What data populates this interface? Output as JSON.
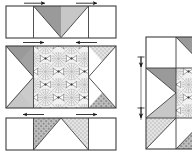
{
  "figure": {
    "type": "quilt-piecing-diagram",
    "canvas": {
      "width": 192,
      "height": 157
    },
    "line_color": "#3a3a3a",
    "palette": {
      "background": "#ffffff",
      "white_patch": "#ffffff",
      "solid_gray": "#9a9a9a",
      "light_gray": "#c9c9c9",
      "dot_gray": "#b4b4b4",
      "floral_bg": "#efefef",
      "outline": "#3d3d3d",
      "arrow": "#1a1a1a"
    }
  },
  "left_figure": {
    "name": "three-row-strips",
    "rows": [
      {
        "id": "row-top",
        "label": "top row",
        "x": 6,
        "y": 6,
        "width": 110,
        "height": 32,
        "patches": [
          {
            "name": "corner-square-left",
            "fill": "white_patch"
          },
          {
            "name": "triangle-down-left",
            "fill": "solid_gray"
          },
          {
            "name": "triangle-down-right",
            "fill": "light_gray"
          },
          {
            "name": "corner-square-right",
            "fill": "white_patch"
          }
        ],
        "arrows": [
          {
            "name": "press-arrow-left",
            "direction": "right",
            "x": 28,
            "y": 3
          },
          {
            "name": "press-arrow-right",
            "direction": "right",
            "x": 80,
            "y": 3
          }
        ]
      },
      {
        "id": "row-middle",
        "label": "middle row",
        "x": 6,
        "y": 46,
        "width": 110,
        "height": 62,
        "patches": [
          {
            "name": "side-triangle-left",
            "fill": "white_patch"
          },
          {
            "name": "corner-triangle-top-left",
            "fill": "solid_gray"
          },
          {
            "name": "corner-triangle-bottom-left",
            "fill": "light_gray"
          },
          {
            "name": "center-square-floral",
            "fill": "floral_bg"
          },
          {
            "name": "side-triangle-right",
            "fill": "white_patch"
          },
          {
            "name": "corner-triangle-top-right",
            "fill": "dot_gray"
          },
          {
            "name": "corner-triangle-bottom-right",
            "fill": "dot_gray"
          }
        ],
        "arrows": [
          {
            "name": "press-arrow-left",
            "direction": "right",
            "x": 27,
            "y": 42
          },
          {
            "name": "press-arrow-right",
            "direction": "left",
            "x": 80,
            "y": 42
          }
        ]
      },
      {
        "id": "row-bottom",
        "label": "bottom row",
        "x": 6,
        "y": 118,
        "width": 110,
        "height": 32,
        "patches": [
          {
            "name": "corner-square-left",
            "fill": "white_patch"
          },
          {
            "name": "triangle-up-left",
            "fill": "dot_gray"
          },
          {
            "name": "triangle-up-right",
            "fill": "light_gray"
          },
          {
            "name": "corner-square-right",
            "fill": "white_patch"
          }
        ],
        "arrows": [
          {
            "name": "press-arrow-left",
            "direction": "left",
            "x": 27,
            "y": 115
          },
          {
            "name": "press-arrow-right",
            "direction": "right",
            "x": 80,
            "y": 115
          }
        ]
      }
    ]
  },
  "right_figure": {
    "name": "assembled-block",
    "label": "assembled block",
    "x": 146,
    "y": 37,
    "width": 58,
    "height": 112,
    "cropped_at_right_edge": true,
    "rows": [
      {
        "name": "assembled-row-top",
        "height": 31
      },
      {
        "name": "assembled-row-middle",
        "height": 50
      },
      {
        "name": "assembled-row-bottom",
        "height": 31
      }
    ],
    "patches": [
      {
        "name": "top-left-square",
        "fill": "white_patch"
      },
      {
        "name": "top-right-triangle",
        "fill": "solid_gray"
      },
      {
        "name": "middle-left-triangle",
        "fill": "white_patch"
      },
      {
        "name": "middle-corner-triangle-top",
        "fill": "solid_gray"
      },
      {
        "name": "middle-corner-triangle-bottom",
        "fill": "light_gray"
      },
      {
        "name": "middle-center-floral",
        "fill": "floral_bg"
      },
      {
        "name": "bottom-left-triangle",
        "fill": "dot_gray"
      },
      {
        "name": "bottom-right-triangle",
        "fill": "dot_gray"
      }
    ],
    "arrows": [
      {
        "name": "seam-arrow-upper",
        "direction": "down",
        "x": 140,
        "y": 60
      },
      {
        "name": "seam-arrow-lower",
        "direction": "down",
        "x": 140,
        "y": 113
      }
    ]
  }
}
